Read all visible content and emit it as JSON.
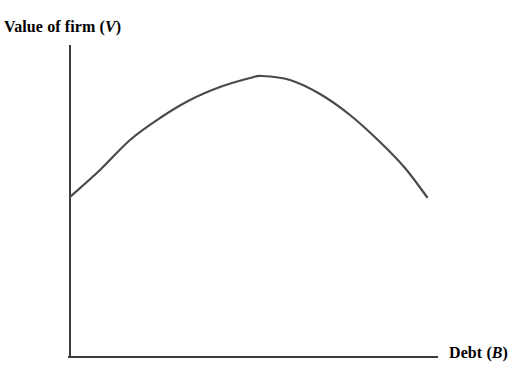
{
  "chart_data": {
    "type": "line",
    "title": "",
    "ylabel": "Value of firm (V)",
    "xlabel": "Debt (B)",
    "ylabel_text": "Value of firm",
    "ylabel_symbol": "V",
    "xlabel_text": "Debt",
    "xlabel_symbol": "B",
    "grid": false,
    "legend": null,
    "axis_ticks": [],
    "tick_labels": [],
    "series": [
      {
        "name": "Value of firm vs debt",
        "comment": "inverted-U curve: value rises with debt to an optimum then declines",
        "x": [
          0,
          10,
          20,
          30,
          40,
          50,
          60,
          70,
          80,
          90,
          100
        ],
        "y": [
          45,
          60,
          72,
          82,
          89,
          94,
          96,
          94,
          88,
          78,
          45
        ],
        "points_px": [
          [
            70,
            197
          ],
          [
            100,
            170
          ],
          [
            130,
            140
          ],
          [
            160,
            118
          ],
          [
            190,
            100
          ],
          [
            220,
            87
          ],
          [
            250,
            78
          ],
          [
            262,
            76
          ],
          [
            290,
            80
          ],
          [
            320,
            94
          ],
          [
            350,
            115
          ],
          [
            380,
            142
          ],
          [
            405,
            168
          ],
          [
            427,
            197
          ]
        ],
        "color": "#4a4a4a",
        "width": 2.2
      }
    ],
    "axes": {
      "color": "#3a3a3a",
      "width": 2,
      "x_axis_px": [
        70,
        357,
        437,
        357
      ],
      "y_axis_px": [
        70,
        46,
        70,
        357
      ]
    },
    "xlim": [
      0,
      100
    ],
    "ylim": [
      0,
      100
    ]
  },
  "labels": {
    "y_axis_label": "Value of firm (",
    "y_axis_label_var": "V",
    "y_axis_label_close": ")",
    "x_axis_label": "Debt (",
    "x_axis_label_var": "B",
    "x_axis_label_close": ")"
  }
}
